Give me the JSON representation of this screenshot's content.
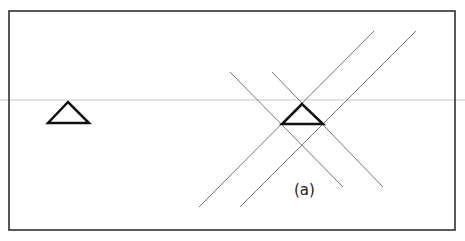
{
  "figure": {
    "label": "(a)",
    "label_pos": [
      294,
      181
    ],
    "frame": {
      "x": 9,
      "y": 11,
      "width": 446,
      "height": 219
    },
    "scan_line_y": 100,
    "left_triangle": {
      "points": [
        [
          68,
          102
        ],
        [
          48,
          123
        ],
        [
          89,
          123
        ]
      ]
    },
    "center_triangle": {
      "points": [
        [
          302,
          104
        ],
        [
          282,
          124
        ],
        [
          323,
          124
        ]
      ]
    },
    "lines": [
      {
        "x1": 199,
        "y1": 207,
        "x2": 374,
        "y2": 31
      },
      {
        "x1": 240,
        "y1": 207,
        "x2": 416,
        "y2": 31
      },
      {
        "x1": 230,
        "y1": 72,
        "x2": 343,
        "y2": 187
      },
      {
        "x1": 272,
        "y1": 72,
        "x2": 383,
        "y2": 187
      }
    ]
  }
}
